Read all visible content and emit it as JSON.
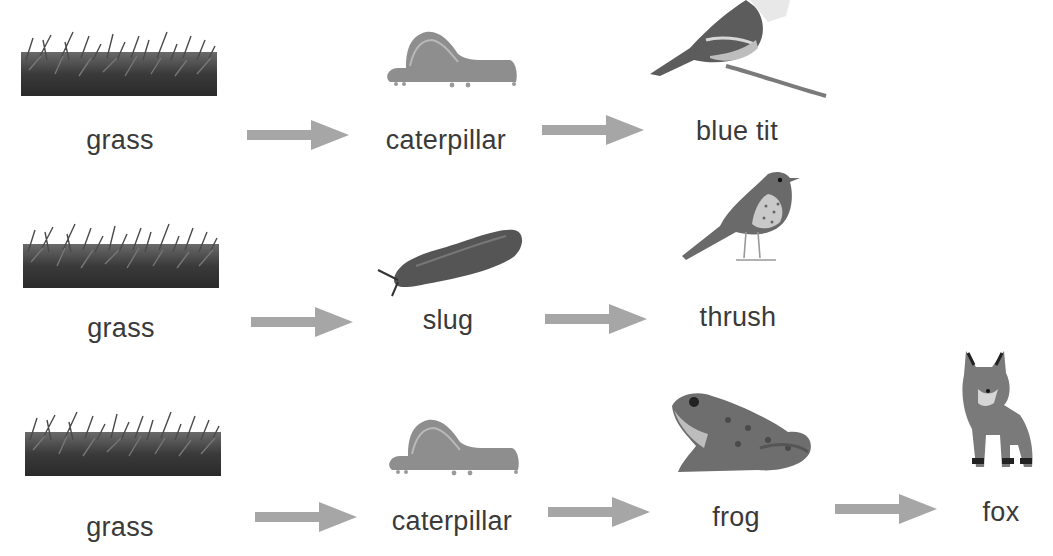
{
  "diagram": {
    "type": "food-chains",
    "arrow_color": "#a6a6a6",
    "chains": [
      {
        "organisms": [
          {
            "name": "grass",
            "icon": "grass-image"
          },
          {
            "name": "caterpillar",
            "icon": "caterpillar-image"
          },
          {
            "name": "blue tit",
            "icon": "blue-tit-image"
          }
        ]
      },
      {
        "organisms": [
          {
            "name": "grass",
            "icon": "grass-image"
          },
          {
            "name": "slug",
            "icon": "slug-image"
          },
          {
            "name": "thrush",
            "icon": "thrush-image"
          }
        ]
      },
      {
        "organisms": [
          {
            "name": "grass",
            "icon": "grass-image"
          },
          {
            "name": "caterpillar",
            "icon": "caterpillar-image"
          },
          {
            "name": "frog",
            "icon": "frog-image"
          },
          {
            "name": "fox",
            "icon": "fox-image"
          }
        ]
      }
    ]
  }
}
